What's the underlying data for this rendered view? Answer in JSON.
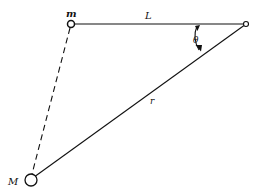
{
  "diagram": {
    "labels": {
      "small_mass": "m",
      "large_mass": "M",
      "length": "L",
      "angle": "θ",
      "distance": "r"
    },
    "colors": {
      "stroke": "#111111",
      "background": "#ffffff"
    },
    "points": {
      "m": [
        71,
        24
      ],
      "pivot": [
        246,
        24
      ],
      "M": [
        31,
        180
      ]
    }
  }
}
